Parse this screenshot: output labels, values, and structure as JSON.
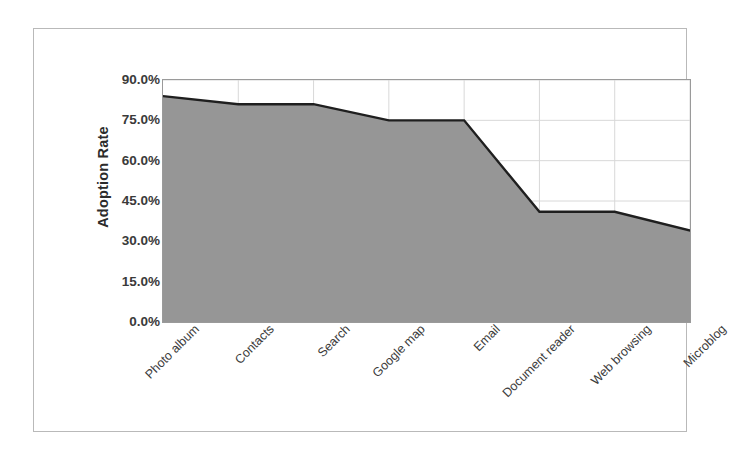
{
  "chart_data": {
    "type": "area",
    "title": "",
    "xlabel": "",
    "ylabel": "Adoption Rate",
    "categories": [
      "Photo album",
      "Contacts",
      "Search",
      "Google map",
      "Email",
      "Document reader",
      "Web browsing",
      "Microblog"
    ],
    "values": [
      84,
      81,
      81,
      75,
      75,
      41,
      41,
      34
    ],
    "series": [
      {
        "name": "Adoption Rate",
        "values": [
          84,
          81,
          81,
          75,
          75,
          41,
          41,
          34
        ]
      }
    ],
    "ylim": [
      0,
      90
    ],
    "ytick_values": [
      90,
      75,
      60,
      45,
      30,
      15,
      0
    ],
    "ytick_labels": [
      "90.0%",
      "75.0%",
      "60.0%",
      "45.0%",
      "30.0%",
      "15.0%",
      "0.0%"
    ],
    "grid": true,
    "grid_axis": "both",
    "legend": false,
    "legend_position": "none",
    "area_fill_color": "#969696",
    "area_line_color": "#1f1f1f",
    "gridline_color": "#d8d8d8",
    "axis_line_color": "#9a9a9a",
    "plot_background": "#ffffff",
    "x_label_rotation": -45
  }
}
